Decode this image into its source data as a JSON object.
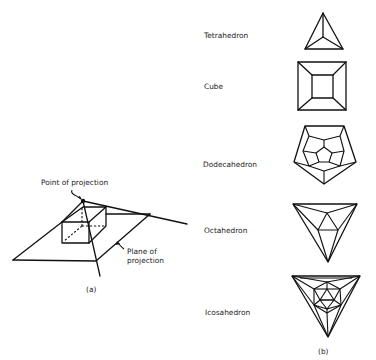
{
  "figure_a": {
    "caption": "(a)",
    "point_label": "Point of projection",
    "plane_label_line1": "Plane of",
    "plane_label_line2": "projection"
  },
  "figure_b": {
    "caption": "(b)",
    "solids": [
      {
        "name": "Tetrahedron"
      },
      {
        "name": "Cube"
      },
      {
        "name": "Dodecahedron"
      },
      {
        "name": "Octahedron"
      },
      {
        "name": "Icosahedron"
      }
    ]
  },
  "colors": {
    "line": "#111111",
    "background": "#ffffff"
  }
}
